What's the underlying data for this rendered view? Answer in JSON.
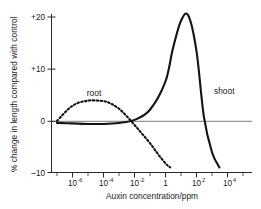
{
  "chart_data": {
    "type": "line",
    "title": "",
    "xlabel": "Auxin concentration/ppm",
    "ylabel": "% change in length compared with control",
    "xscale": "log",
    "xlim": [
      1e-07,
      100000.0
    ],
    "ylim": [
      -10,
      22
    ],
    "grid": false,
    "legend_position": "inline-annotations",
    "x_tick_labels": [
      "10⁻⁶",
      "10⁻⁴",
      "10⁻²",
      "1",
      "10²",
      "10⁴"
    ],
    "x_tick_bases": [
      "10",
      "10",
      "10",
      "1",
      "10",
      "10"
    ],
    "x_tick_exponents": [
      "-6",
      "-4",
      "-2",
      "",
      "2",
      "4"
    ],
    "x_tick_values": [
      1e-06,
      0.0001,
      0.01,
      1,
      100,
      10000
    ],
    "y_tick_labels": [
      "+20",
      "+10",
      "0",
      "–10"
    ],
    "y_tick_values": [
      20,
      10,
      0,
      -10
    ],
    "series": [
      {
        "name": "root",
        "label": "root",
        "style": "dashed",
        "color": "#141414",
        "x": [
          1e-07,
          1e-06,
          1e-05,
          0.0001,
          0.0003,
          0.001,
          0.003,
          0.01,
          0.03,
          0.1,
          0.3,
          1,
          2
        ],
        "values": [
          0.2,
          3.2,
          4.2,
          4.1,
          3.6,
          2.6,
          1.2,
          -0.6,
          -2.3,
          -4.2,
          -6.2,
          -8.2,
          -9.0
        ]
      },
      {
        "name": "shoot",
        "label": "shoot",
        "style": "solid",
        "color": "#141414",
        "x": [
          1e-07,
          1e-06,
          1e-05,
          0.0001,
          0.001,
          0.01,
          0.1,
          1,
          3,
          10,
          30,
          100,
          300,
          1000,
          3000
        ],
        "values": [
          -0.2,
          -0.3,
          -0.4,
          -0.4,
          -0.2,
          0.4,
          2.4,
          8.0,
          14.5,
          20.0,
          21.0,
          14.0,
          1.0,
          -6.0,
          -9.0
        ]
      }
    ],
    "annotations": [
      {
        "text": "root",
        "x": 0.0001,
        "y": 7.0
      },
      {
        "text": "shoot",
        "x": 600,
        "y": 9.0
      }
    ]
  }
}
